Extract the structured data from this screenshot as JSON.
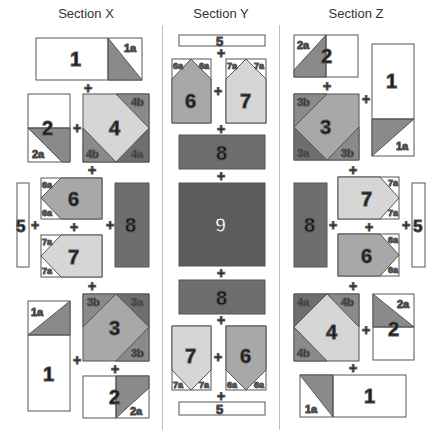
{
  "sections": [
    {
      "id": "X",
      "title": "Section X"
    },
    {
      "id": "Y",
      "title": "Section Y"
    },
    {
      "id": "Z",
      "title": "Section Z"
    }
  ],
  "colors": {
    "white": "#ffffff",
    "light": "#d6d6d6",
    "medium": "#a8a8a8",
    "mediumDark": "#8a8a8a",
    "dark": "#6e6e6e",
    "darkest": "#5c5c5c",
    "outline": "#555555"
  },
  "labels": {
    "u1": "1",
    "u1a": "1a",
    "u2": "2",
    "u2a": "2a",
    "u3": "3",
    "u3a": "3a",
    "u3b": "3b",
    "u4": "4",
    "u4a": "4a",
    "u4b": "4b",
    "u5": "5",
    "u6": "6",
    "u6a": "6a",
    "u7": "7",
    "u7a": "7a",
    "u8": "8",
    "u9": "9",
    "plus": "+"
  }
}
